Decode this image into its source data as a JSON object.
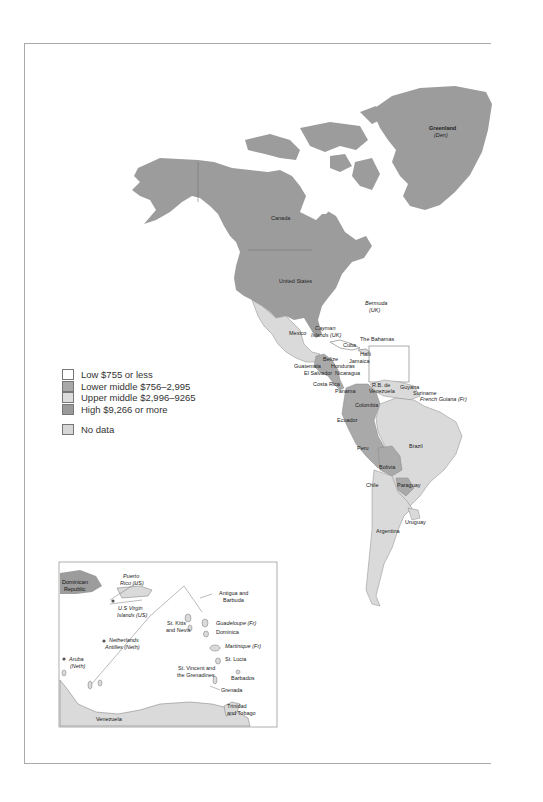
{
  "legend": {
    "items": [
      {
        "label": "Low $755 or less",
        "color": "#ffffff"
      },
      {
        "label": "Lower middle $756–2,995",
        "color": "#a8a8a8"
      },
      {
        "label": "Upper middle $2,996–9265",
        "color": "#dcdcdc"
      },
      {
        "label": "High $9,266 or more",
        "color": "#9a9a9a"
      }
    ],
    "no_data": {
      "label": "No data",
      "color": "#d6d6d6"
    }
  },
  "colors": {
    "high": "#999999",
    "upper_middle": "#dadada",
    "lower_middle": "#a9a9a9",
    "low": "#ffffff",
    "frame": "#aaaaaa",
    "outline": "#777777"
  },
  "main_map": {
    "labels": {
      "greenland": "Greenland",
      "greenland_sub": "(Den)",
      "canada": "Canada",
      "united_states": "United States",
      "bermuda": "Bermuda",
      "bermuda_sub": "(UK)",
      "mexico": "Mexico",
      "cayman": "Cayman",
      "cayman_sub": "Islands (UK)",
      "bahamas": "The Bahamas",
      "cuba": "Cuba",
      "haiti": "Haiti",
      "jamaica": "Jamaica",
      "belize": "Belize",
      "honduras": "Honduras",
      "guatemala": "Guatemala",
      "el_salvador": "El Salvador",
      "nicaragua": "Nicaragua",
      "costa_rica": "Costa Rica",
      "panama": "Panama",
      "venezuela": "R.B. de",
      "venezuela_sub": "Venezuela",
      "guyana": "Guyana",
      "suriname": "Suriname",
      "french_guiana": "French Guiana (Fr)",
      "colombia": "Colombia",
      "ecuador": "Ecuador",
      "peru": "Peru",
      "brazil": "Brazil",
      "bolivia": "Bolivia",
      "chile": "Chile",
      "paraguay": "Paraguay",
      "uruguay": "Uruguay",
      "argentina": "Argentina"
    }
  },
  "inset_map": {
    "labels": {
      "dominican_republic": "Dominican",
      "dominican_republic_sub": "Republic",
      "puerto_rico": "Puerto",
      "puerto_rico_sub": "Rico (US)",
      "us_virgin": "U.S Virgin",
      "us_virgin_sub": "Islands (US)",
      "netherlands_antilles": "Netherlands",
      "netherlands_antilles_sub": "Antilles (Neth)",
      "aruba": "Aruba",
      "aruba_sub": "(Neth)",
      "st_kitts": "St. Kitts",
      "st_kitts_sub": "and Nevis",
      "antigua": "Antigua and",
      "antigua_sub": "Barbuda",
      "guadeloupe": "Guadeloupe (Fr)",
      "dominica": "Dominica",
      "martinique": "Martinique (Fr)",
      "st_lucia": "St. Lucia",
      "st_vincent": "St. Vincent and",
      "st_vincent_sub": "the Grenadines",
      "barbados": "Barbados",
      "grenada": "Grenada",
      "trinidad": "Trinidad",
      "trinidad_sub": "and Tobago",
      "venezuela": "Venezuela"
    }
  }
}
